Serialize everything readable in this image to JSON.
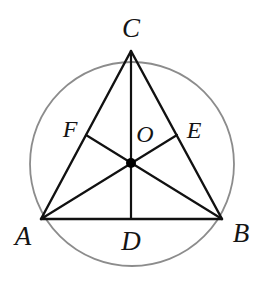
{
  "figure": {
    "canvas": {
      "width": 266,
      "height": 285,
      "background": "#ffffff"
    },
    "colors": {
      "circle_stroke": "#8c8c8c",
      "segment_stroke": "#111111",
      "centroid_fill": "#000000",
      "label_color": "#141414"
    },
    "stroke_widths": {
      "circle": 1.8,
      "triangle_side": 2.4,
      "median": 2.2,
      "midsegment": 2.2
    }
  },
  "circle": {
    "name": "circumcircle",
    "center_x": 132,
    "center_y": 164,
    "radius": 102
  },
  "points": {
    "A": {
      "label": "A",
      "x": 41,
      "y": 219,
      "label_x": 23,
      "label_y": 236
    },
    "B": {
      "label": "B",
      "x": 222,
      "y": 219,
      "label_x": 241,
      "label_y": 233
    },
    "C": {
      "label": "C",
      "x": 131,
      "y": 51,
      "label_x": 131,
      "label_y": 28
    },
    "D": {
      "label": "D",
      "x": 131,
      "y": 219,
      "label_x": 131,
      "label_y": 241
    },
    "E": {
      "label": "E",
      "x": 177,
      "y": 135,
      "label_x": 194,
      "label_y": 130
    },
    "F": {
      "label": "F",
      "x": 86,
      "y": 135,
      "label_x": 70,
      "label_y": 129
    },
    "O": {
      "label": "O",
      "x": 131,
      "y": 163,
      "label_x": 145,
      "label_y": 134,
      "dot_radius": 5
    }
  },
  "segments": [
    {
      "name": "side-AB",
      "from": "A",
      "to": "B"
    },
    {
      "name": "side-BC",
      "from": "B",
      "to": "C"
    },
    {
      "name": "side-CA",
      "from": "C",
      "to": "A"
    },
    {
      "name": "median-CD",
      "from": "C",
      "to": "D"
    },
    {
      "name": "median-AE",
      "from": "A",
      "to": "E"
    },
    {
      "name": "median-BF",
      "from": "B",
      "to": "F"
    }
  ],
  "labels": {
    "A": "A",
    "B": "B",
    "C": "C",
    "D": "D",
    "E": "E",
    "F": "F",
    "O": "O"
  }
}
